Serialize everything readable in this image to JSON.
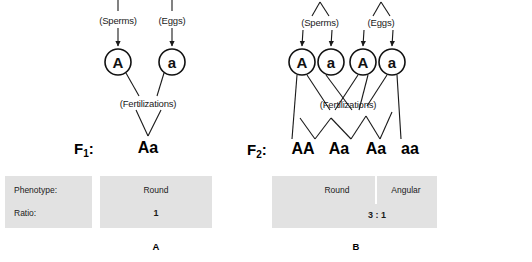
{
  "figure": {
    "background_color": "#ffffff",
    "panel_fill": "#e2e2e2",
    "line_color": "#1a1a1a"
  },
  "panels": [
    {
      "id": "A",
      "letter": "A",
      "generation_label": "F",
      "generation_subscript": "1",
      "generation_colon": ":",
      "sperm_caption": "(Sperms)",
      "egg_caption": "(Eggs)",
      "fertilization_caption": "(Fertilizations)",
      "sperm_gametes": [
        "A"
      ],
      "egg_gametes": [
        "a"
      ],
      "offspring": [
        "Aa"
      ],
      "table": {
        "row_labels": [
          "Phenotype:",
          "Ratio:"
        ],
        "phenotypes": [
          "Round"
        ],
        "ratio": "1"
      }
    },
    {
      "id": "B",
      "letter": "B",
      "generation_label": "F",
      "generation_subscript": "2",
      "generation_colon": ":",
      "sperm_caption": "(Sperms)",
      "egg_caption": "(Eggs)",
      "fertilization_caption": "(Fertilizations)",
      "sperm_gametes": [
        "A",
        "a"
      ],
      "egg_gametes": [
        "A",
        "a"
      ],
      "offspring": [
        "AA",
        "Aa",
        "Aa",
        "aa"
      ],
      "table": {
        "row_labels": [],
        "phenotypes": [
          "Round",
          "Angular"
        ],
        "ratio": "3 : 1"
      }
    }
  ]
}
